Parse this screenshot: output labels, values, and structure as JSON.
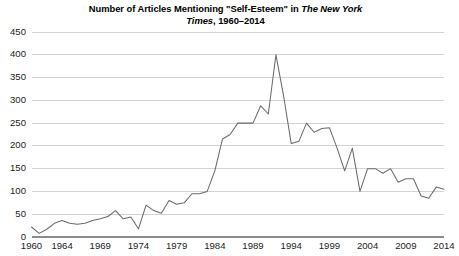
{
  "chart_data": {
    "type": "line",
    "title": "Number of Articles Mentioning \"Self-Esteem\" in The New York Times, 1960–2014",
    "title_line1_plain": "Number of Articles Mentioning \"Self-Esteem\" in ",
    "title_line1_italic": "The New York",
    "title_line2_italic": "Times",
    "title_line2_plain": ", 1960–2014",
    "xlabel": "",
    "ylabel": "",
    "ylim": [
      0,
      450
    ],
    "xlim": [
      1960,
      2014
    ],
    "grid": true,
    "legend": "none",
    "line_color": "#6b6b6b",
    "grid_color": "#c8c8c8",
    "axis_color": "#8c8c8c",
    "background_color": "#ffffff",
    "ytick_labels": [
      "0",
      "50",
      "100",
      "150",
      "200",
      "250",
      "300",
      "350",
      "400",
      "450"
    ],
    "ytick_values": [
      0,
      50,
      100,
      150,
      200,
      250,
      300,
      350,
      400,
      450
    ],
    "xtick_labels": [
      "1960",
      "1964",
      "1969",
      "1974",
      "1979",
      "1984",
      "1989",
      "1994",
      "1999",
      "2004",
      "2009",
      "2014"
    ],
    "xtick_values": [
      1960,
      1964,
      1969,
      1974,
      1979,
      1984,
      1989,
      1994,
      1999,
      2004,
      2009,
      2014
    ],
    "x": [
      1960,
      1961,
      1962,
      1963,
      1964,
      1965,
      1966,
      1967,
      1968,
      1969,
      1970,
      1971,
      1972,
      1973,
      1974,
      1975,
      1976,
      1977,
      1978,
      1979,
      1980,
      1981,
      1982,
      1983,
      1984,
      1985,
      1986,
      1987,
      1988,
      1989,
      1990,
      1991,
      1992,
      1993,
      1994,
      1995,
      1996,
      1997,
      1998,
      1999,
      2000,
      2001,
      2002,
      2003,
      2004,
      2005,
      2006,
      2007,
      2008,
      2009,
      2010,
      2011,
      2012,
      2013,
      2014
    ],
    "values": [
      22,
      8,
      17,
      30,
      36,
      30,
      28,
      30,
      36,
      40,
      45,
      58,
      40,
      44,
      18,
      70,
      58,
      52,
      80,
      72,
      75,
      95,
      95,
      100,
      145,
      215,
      225,
      250,
      250,
      250,
      288,
      270,
      400,
      310,
      205,
      210,
      250,
      230,
      238,
      240,
      195,
      145,
      195,
      100,
      150,
      150,
      140,
      150,
      120,
      128,
      128,
      90,
      85,
      110,
      105
    ],
    "series_name": "Articles mentioning \"Self-Esteem\"",
    "annotations": []
  },
  "figure": {
    "width": 451,
    "height": 256
  }
}
